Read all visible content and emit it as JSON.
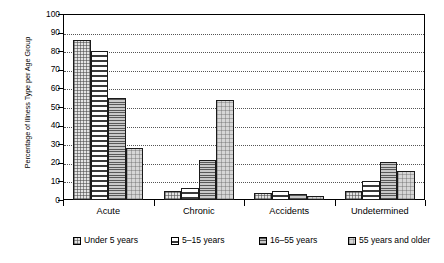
{
  "chart_data": {
    "type": "bar",
    "title": "",
    "xlabel": "",
    "ylabel": "Percentage of Illness Type per Age Group",
    "ylim": [
      0,
      100
    ],
    "ytick_step": 10,
    "ytick_labels": [
      "100",
      "90",
      "80",
      "70",
      "60",
      "50",
      "40",
      "30",
      "20",
      "10",
      "0"
    ],
    "grid": true,
    "grid_axis": "y",
    "legend_position": "bottom",
    "categories": [
      "Acute",
      "Chronic",
      "Accidents",
      "Undetermined"
    ],
    "series": [
      {
        "name": "Under 5 years",
        "values": [
          86,
          5,
          4,
          5
        ],
        "pattern": "checker-dot",
        "color": "#e4e4e4"
      },
      {
        "name": "5–15 years",
        "values": [
          80,
          6.5,
          5,
          10
        ],
        "pattern": "vertical-dash",
        "color": "#ffffff"
      },
      {
        "name": "16–55 years",
        "values": [
          55,
          21.5,
          3.5,
          20.5
        ],
        "pattern": "horizontal-line",
        "color": "#c9c9c9"
      },
      {
        "name": "55 years and older",
        "values": [
          28,
          54,
          2,
          15.5
        ],
        "pattern": "speckle",
        "color": "#d6d6d6"
      }
    ]
  },
  "legend": {
    "items": [
      {
        "label": "Under 5 years"
      },
      {
        "label": "5–15 years"
      },
      {
        "label": "16–55 years"
      },
      {
        "label": "55 years and older"
      }
    ]
  }
}
